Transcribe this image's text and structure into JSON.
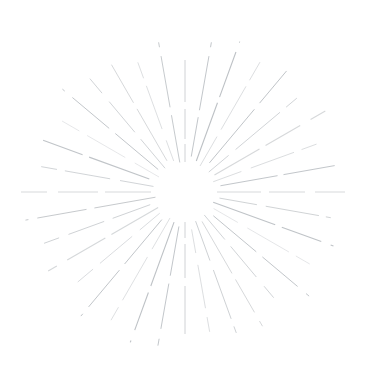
{
  "artwork": {
    "title": "Radial Sunburst Line Burst",
    "type": "vector-illustration",
    "alt_text": "Starburst of thin dashed gray rays radiating from an empty circular center",
    "canvas": {
      "width": 368,
      "height": 382,
      "background_color": "#ffffff"
    },
    "center": {
      "x": 185,
      "y": 192
    },
    "inner_radius": 30,
    "stroke": {
      "color": "#9aa0a6",
      "secondary_color": "#b8bcc0",
      "width_min": 0.7,
      "width_max": 1.3,
      "dash_pattern": "sketchy-broken",
      "opacity_min": 0.35,
      "opacity_max": 0.85
    },
    "ray_count": 36,
    "rays": [
      {
        "angle": 0,
        "inner": 30,
        "outer": 136,
        "width": 1.2,
        "opacity": 0.55,
        "dash": "18 5 30 7 42 6 26 9"
      },
      {
        "angle": 10,
        "inner": 36,
        "outer": 152,
        "width": 1.0,
        "opacity": 0.6,
        "dash": "40 7 55 9 30 8"
      },
      {
        "angle": 20,
        "inner": 33,
        "outer": 160,
        "width": 1.1,
        "opacity": 0.65,
        "dash": "62 6 48 10 28 7"
      },
      {
        "angle": 30,
        "inner": 30,
        "outer": 150,
        "width": 0.9,
        "opacity": 0.55,
        "dash": "34 8 50 7 36 9"
      },
      {
        "angle": 40,
        "inner": 38,
        "outer": 158,
        "width": 1.0,
        "opacity": 0.62,
        "dash": "70 8 44 11 22 6"
      },
      {
        "angle": 50,
        "inner": 31,
        "outer": 146,
        "width": 0.9,
        "opacity": 0.5,
        "dash": "26 9 58 8 34 10"
      },
      {
        "angle": 60,
        "inner": 34,
        "outer": 162,
        "width": 1.1,
        "opacity": 0.58,
        "dash": "52 7 40 12 38 7"
      },
      {
        "angle": 70,
        "inner": 30,
        "outer": 140,
        "width": 0.8,
        "opacity": 0.45,
        "dash": "30 10 46 8 28 11"
      },
      {
        "angle": 80,
        "inner": 36,
        "outer": 156,
        "width": 1.0,
        "opacity": 0.6,
        "dash": "58 6 52 9 30 8"
      },
      {
        "angle": 90,
        "inner": 32,
        "outer": 160,
        "width": 1.0,
        "opacity": 0.55,
        "dash": "44 8 36 10 50 7"
      },
      {
        "angle": 100,
        "inner": 35,
        "outer": 148,
        "width": 0.9,
        "opacity": 0.52,
        "dash": "38 9 54 7 26 10"
      },
      {
        "angle": 110,
        "inner": 30,
        "outer": 158,
        "width": 1.1,
        "opacity": 0.63,
        "dash": "66 7 42 10 32 8"
      },
      {
        "angle": 120,
        "inner": 33,
        "outer": 144,
        "width": 0.8,
        "opacity": 0.47,
        "dash": "28 11 48 8 30 9"
      },
      {
        "angle": 130,
        "inner": 37,
        "outer": 162,
        "width": 1.0,
        "opacity": 0.6,
        "dash": "56 8 46 11 34 7"
      },
      {
        "angle": 140,
        "inner": 30,
        "outer": 138,
        "width": 0.9,
        "opacity": 0.5,
        "dash": "32 9 40 12 26 8"
      },
      {
        "angle": 150,
        "inner": 34,
        "outer": 155,
        "width": 1.0,
        "opacity": 0.58,
        "dash": "60 7 38 10 40 9"
      },
      {
        "angle": 160,
        "inner": 31,
        "outer": 150,
        "width": 0.9,
        "opacity": 0.54,
        "dash": "42 10 52 8 28 11"
      },
      {
        "angle": 170,
        "inner": 38,
        "outer": 142,
        "width": 0.8,
        "opacity": 0.44,
        "dash": "24 12 44 9 30 10"
      },
      {
        "angle": 180,
        "inner": 30,
        "outer": 146,
        "width": 1.2,
        "opacity": 0.55,
        "dash": "16 6 34 8 48 7 22 9"
      },
      {
        "angle": 190,
        "inner": 35,
        "outer": 156,
        "width": 1.0,
        "opacity": 0.6,
        "dash": "50 8 46 10 36 7"
      },
      {
        "angle": 200,
        "inner": 32,
        "outer": 160,
        "width": 1.1,
        "opacity": 0.64,
        "dash": "68 7 40 11 30 8"
      },
      {
        "angle": 210,
        "inner": 30,
        "outer": 148,
        "width": 0.9,
        "opacity": 0.52,
        "dash": "36 9 50 8 32 10"
      },
      {
        "angle": 220,
        "inner": 36,
        "outer": 162,
        "width": 1.0,
        "opacity": 0.61,
        "dash": "58 8 48 9 28 11"
      },
      {
        "angle": 230,
        "inner": 33,
        "outer": 140,
        "width": 0.8,
        "opacity": 0.46,
        "dash": "26 10 42 9 30 8"
      },
      {
        "angle": 240,
        "inner": 31,
        "outer": 158,
        "width": 1.1,
        "opacity": 0.59,
        "dash": "54 7 44 12 36 8"
      },
      {
        "angle": 250,
        "inner": 37,
        "outer": 150,
        "width": 0.9,
        "opacity": 0.53,
        "dash": "40 9 38 10 34 9"
      },
      {
        "angle": 260,
        "inner": 30,
        "outer": 162,
        "width": 1.0,
        "opacity": 0.57,
        "dash": "62 8 50 9 28 10"
      },
      {
        "angle": 270,
        "inner": 34,
        "outer": 164,
        "width": 1.0,
        "opacity": 0.55,
        "dash": "46 7 40 11 48 8"
      },
      {
        "angle": 280,
        "inner": 32,
        "outer": 146,
        "width": 0.9,
        "opacity": 0.5,
        "dash": "34 10 46 8 30 11"
      },
      {
        "angle": 290,
        "inner": 38,
        "outer": 158,
        "width": 1.1,
        "opacity": 0.62,
        "dash": "64 7 42 10 30 9"
      },
      {
        "angle": 300,
        "inner": 30,
        "outer": 142,
        "width": 0.8,
        "opacity": 0.45,
        "dash": "28 11 44 9 26 10"
      },
      {
        "angle": 310,
        "inner": 35,
        "outer": 160,
        "width": 1.0,
        "opacity": 0.6,
        "dash": "56 8 48 10 32 7"
      },
      {
        "angle": 320,
        "inner": 31,
        "outer": 148,
        "width": 0.9,
        "opacity": 0.51,
        "dash": "38 9 40 11 34 8"
      },
      {
        "angle": 330,
        "inner": 36,
        "outer": 156,
        "width": 1.0,
        "opacity": 0.58,
        "dash": "60 7 44 9 36 10"
      },
      {
        "angle": 340,
        "inner": 33,
        "outer": 138,
        "width": 0.8,
        "opacity": 0.43,
        "dash": "22 12 46 8 28 9"
      },
      {
        "angle": 350,
        "inner": 30,
        "outer": 152,
        "width": 1.0,
        "opacity": 0.56,
        "dash": "48 8 52 9 30 10"
      }
    ]
  }
}
